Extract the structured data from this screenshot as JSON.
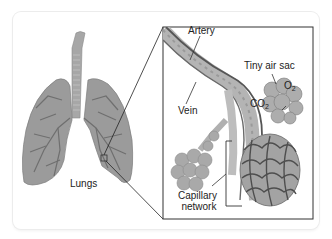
{
  "diagram": {
    "labels": {
      "lungs": "Lungs",
      "artery": "Artery",
      "vein": "Vein",
      "air_sac": "Tiny air sac",
      "o2": "O",
      "o2_sub": "2",
      "co2": "CO",
      "co2_sub": "2",
      "capillary_line1": "Capillary",
      "capillary_line2": "network"
    },
    "colors": {
      "lung_fill": "#9b9b9b",
      "lung_vessels": "#6f6f6f",
      "vessel_dark": "#5a5a5a",
      "vessel_light": "#b4b4b4",
      "alveoli": "#a9a9a9",
      "inset_border": "#333333"
    }
  }
}
